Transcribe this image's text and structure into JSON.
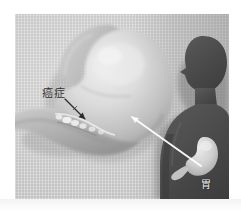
{
  "figure": {
    "kind": "medical-illustration",
    "background_color": "#c9c9c9",
    "matte_color": "#ffffff"
  },
  "labels": {
    "cancer": {
      "text": "癌症",
      "color": "#2d2d2d",
      "points_to": "gastric-lesion"
    },
    "stomach": {
      "text": "胃",
      "color": "#f0f0f0",
      "points_to": "body-stomach"
    }
  },
  "pointers": {
    "cancer_arrow": {
      "name": "cancer-pointer-arrow",
      "color": "#2b2b2b",
      "from": [
        52,
        86
      ],
      "to": [
        70,
        105
      ]
    },
    "callout_line": {
      "name": "stomach-callout-line",
      "color": "#f2f2f2",
      "from": [
        117,
        103
      ],
      "to": [
        186,
        152
      ]
    }
  },
  "anatomy": {
    "esophagus": {
      "name": "esophagus",
      "fill": "#c4c4c4"
    },
    "stomach_body": {
      "name": "stomach-body",
      "fill": "#dcdcdc"
    },
    "duodenum": {
      "name": "duodenum",
      "fill": "#b6b6b6"
    },
    "lesion": {
      "name": "gastric-lesion",
      "fill": "#efefef"
    },
    "silhouette": {
      "name": "human-silhouette",
      "fill": "#4a4a4a"
    },
    "body_stomach": {
      "name": "body-stomach",
      "fill": "#d8d8d8"
    }
  }
}
